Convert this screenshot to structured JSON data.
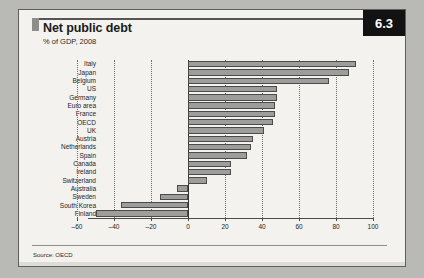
{
  "figure": {
    "number_badge": "6.3",
    "title": "Net public debt",
    "subtitle": "% of GDP, 2008",
    "source": "Source: OECD"
  },
  "chart_data": {
    "type": "bar",
    "orientation": "horizontal",
    "title": "Net public debt",
    "subtitle": "% of GDP, 2008",
    "xlabel": "",
    "ylabel": "",
    "xlim": [
      -60,
      100
    ],
    "xticks": [
      -60,
      -40,
      -20,
      0,
      20,
      40,
      60,
      80,
      100
    ],
    "xtick_labels": [
      "–60",
      "–40",
      "–20",
      "0",
      "20",
      "40",
      "60",
      "80",
      "100"
    ],
    "grid": "vertical-dotted",
    "legend": "none",
    "bar_color": "#9d9d9b",
    "bar_edge_color": "#4b4b49",
    "categories": [
      "Italy",
      "Japan",
      "Belgium",
      "US",
      "Germany",
      "Euro area",
      "France",
      "OECD",
      "UK",
      "Austria",
      "Netherlands",
      "Spain",
      "Canada",
      "Ireland",
      "Switzerland",
      "Australia",
      "Sweden",
      "South Korea",
      "Finland"
    ],
    "values": [
      91,
      87,
      76,
      48,
      48,
      47,
      47,
      46,
      41,
      35,
      34,
      32,
      23,
      23,
      10,
      -6,
      -15,
      -36,
      -50
    ],
    "series": [
      {
        "name": "Net public debt, % of GDP 2008",
        "values": [
          91,
          87,
          76,
          48,
          48,
          47,
          47,
          46,
          41,
          35,
          34,
          32,
          23,
          23,
          10,
          -6,
          -15,
          -36,
          -50
        ]
      }
    ],
    "source": "Source: OECD"
  }
}
